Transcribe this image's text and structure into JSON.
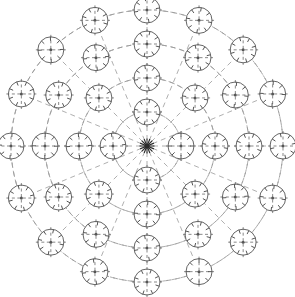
{
  "figure": {
    "caption": "",
    "width": 295,
    "height": 297,
    "background_color": "#ffffff"
  },
  "style": {
    "line_color": "#4a4a4a",
    "node_stroke_color": "#555555",
    "ring_color": "#8a8a8a",
    "connector_color": "#9a9a9a",
    "hub_color": "#2a2a2a",
    "node_fill": "#ffffff",
    "ring_dash": "5 4",
    "connector_dash": "5 4",
    "line_width": 0.8,
    "node_line_width": 0.9
  },
  "chart_data": {
    "type": "scatter",
    "xlabel": "",
    "ylabel": "",
    "coordinate_system": "polar",
    "center": {
      "x": 147,
      "y": 146
    },
    "ring_radii": [
      34,
      68,
      102,
      136
    ],
    "ring_count": 4,
    "node_radius": 13,
    "nodes_per_ring": [
      4,
      8,
      12,
      16
    ],
    "total_nodes": 40,
    "hub": {
      "x": 147,
      "y": 146,
      "type": "hub-star",
      "spokes": 16,
      "radius": 4
    },
    "rings": [
      {
        "index": 1,
        "radius": 34,
        "node_count": 4,
        "angles_deg": [
          0,
          90,
          180,
          270
        ]
      },
      {
        "index": 2,
        "radius": 68,
        "node_count": 8,
        "angles_deg": [
          0,
          45,
          90,
          135,
          180,
          225,
          270,
          315
        ]
      },
      {
        "index": 3,
        "radius": 102,
        "node_count": 12,
        "angles_deg": [
          0,
          30,
          60,
          90,
          120,
          150,
          180,
          210,
          240,
          270,
          300,
          330
        ]
      },
      {
        "index": 4,
        "radius": 136,
        "node_count": 16,
        "angles_deg": [
          0,
          22.5,
          45,
          67.5,
          90,
          112.5,
          135,
          157.5,
          180,
          202.5,
          225,
          247.5,
          270,
          292.5,
          315,
          337.5
        ]
      }
    ],
    "node_glyph": {
      "shape": "circle",
      "has_center_dot": true,
      "has_crosshair": true,
      "crosshair_style": "dashed",
      "tick_count": 8,
      "tick_length": 4,
      "description": "circle with dashed crosshair, central dot and eight short perimeter ticks"
    },
    "connectors": {
      "radial_spokes": true,
      "ring_arcs": true,
      "style": "dashed",
      "description": "dashed radial spokes from hub outward and dashed arcs joining nodes within each ring"
    },
    "legend": [],
    "annotations": [],
    "grid": true
  }
}
